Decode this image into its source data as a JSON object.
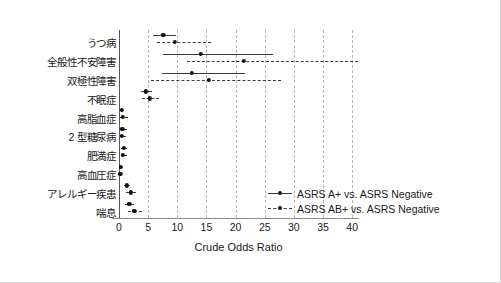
{
  "chart_data": {
    "type": "scatter",
    "title": "",
    "xlabel": "Crude Odds Ratio",
    "ylabel": "",
    "xlim": [
      0,
      41
    ],
    "xticks": [
      0,
      5,
      10,
      15,
      20,
      25,
      30,
      35,
      40
    ],
    "xtick_labels": [
      "0",
      "5",
      "10",
      "15",
      "20",
      "25",
      "30",
      "35",
      "40"
    ],
    "grid": "vertical-dashed",
    "legend_position": "inside-lower-right",
    "categories": [
      "うつ病",
      "全般性不安障害",
      "双極性障害",
      "不眠症",
      "高脂血症",
      "2 型糖尿病",
      "肥満症",
      "高血圧症",
      "アレルギー疾患",
      "喘息"
    ],
    "series": [
      {
        "name": "ASRS A+ vs. ASRS Negative",
        "style": "solid",
        "values": [
          7.6,
          14.0,
          12.5,
          4.6,
          0.5,
          0.6,
          0.8,
          0.3,
          1.3,
          1.8
        ],
        "ci_low": [
          5.9,
          7.5,
          7.3,
          3.7,
          0.2,
          0.2,
          0.4,
          0.1,
          0.8,
          1.1
        ],
        "ci_high": [
          9.8,
          26.4,
          21.7,
          5.6,
          0.9,
          1.4,
          1.3,
          0.7,
          1.9,
          2.6
        ]
      },
      {
        "name": "ASRS AB+ vs. ASRS Negative",
        "style": "dashed",
        "values": [
          9.6,
          21.4,
          15.4,
          5.3,
          0.7,
          0.5,
          0.7,
          0.2,
          2.0,
          2.6
        ],
        "ci_low": [
          6.5,
          11.7,
          5.5,
          4.0,
          0.2,
          0.1,
          0.3,
          0.0,
          1.2,
          1.5
        ],
        "ci_high": [
          15.7,
          41.0,
          27.8,
          6.8,
          1.5,
          1.2,
          1.4,
          0.6,
          3.0,
          4.0
        ]
      }
    ]
  },
  "legend": {
    "entries": [
      {
        "label": "ASRS A+ vs. ASRS Negative",
        "style": "solid"
      },
      {
        "label": "ASRS AB+ vs. ASRS Negative",
        "style": "dashed"
      }
    ]
  },
  "colors": {
    "marker": "#141414",
    "line": "#3b3b3b",
    "grid": "#b6b6b6",
    "axis": "#555555",
    "background": "#ffffff"
  }
}
